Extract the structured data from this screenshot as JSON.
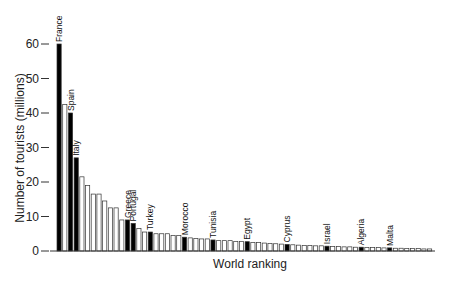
{
  "chart_data": {
    "type": "bar",
    "title": "",
    "xlabel": "World ranking",
    "ylabel": "Number of tourists (millions)",
    "ylim": [
      0,
      60
    ],
    "yticks": [
      0,
      10,
      20,
      30,
      40,
      50,
      60
    ],
    "grid": false,
    "legend": null,
    "colors": {
      "highlighted": "#000000",
      "other": "#ffffff",
      "outline": "#333333"
    },
    "bars": [
      {
        "label": "France",
        "value": 60,
        "highlight": true
      },
      {
        "label": "",
        "value": 42.5,
        "highlight": false
      },
      {
        "label": "Spain",
        "value": 40,
        "highlight": true
      },
      {
        "label": "Italy",
        "value": 27,
        "highlight": true
      },
      {
        "label": "",
        "value": 21.5,
        "highlight": false
      },
      {
        "label": "",
        "value": 19,
        "highlight": false
      },
      {
        "label": "",
        "value": 16.5,
        "highlight": false
      },
      {
        "label": "",
        "value": 16.5,
        "highlight": false
      },
      {
        "label": "",
        "value": 14.5,
        "highlight": false
      },
      {
        "label": "",
        "value": 12.5,
        "highlight": false
      },
      {
        "label": "",
        "value": 12.5,
        "highlight": false
      },
      {
        "label": "",
        "value": 9,
        "highlight": false
      },
      {
        "label": "Greece",
        "value": 9,
        "highlight": true
      },
      {
        "label": "Portugal",
        "value": 8,
        "highlight": true
      },
      {
        "label": "",
        "value": 6.5,
        "highlight": false
      },
      {
        "label": "",
        "value": 5.5,
        "highlight": false
      },
      {
        "label": "Turkey",
        "value": 5.5,
        "highlight": true
      },
      {
        "label": "",
        "value": 5,
        "highlight": false
      },
      {
        "label": "",
        "value": 5,
        "highlight": false
      },
      {
        "label": "",
        "value": 5,
        "highlight": false
      },
      {
        "label": "",
        "value": 4.5,
        "highlight": false
      },
      {
        "label": "",
        "value": 4.5,
        "highlight": false
      },
      {
        "label": "Morocco",
        "value": 4,
        "highlight": true
      },
      {
        "label": "",
        "value": 3.8,
        "highlight": false
      },
      {
        "label": "",
        "value": 3.6,
        "highlight": false
      },
      {
        "label": "",
        "value": 3.5,
        "highlight": false
      },
      {
        "label": "",
        "value": 3.5,
        "highlight": false
      },
      {
        "label": "Tunisia",
        "value": 3.2,
        "highlight": true
      },
      {
        "label": "",
        "value": 3,
        "highlight": false
      },
      {
        "label": "",
        "value": 3,
        "highlight": false
      },
      {
        "label": "",
        "value": 3,
        "highlight": false
      },
      {
        "label": "",
        "value": 2.8,
        "highlight": false
      },
      {
        "label": "",
        "value": 2.8,
        "highlight": false
      },
      {
        "label": "Egypt",
        "value": 2.7,
        "highlight": true
      },
      {
        "label": "",
        "value": 2.5,
        "highlight": false
      },
      {
        "label": "",
        "value": 2.5,
        "highlight": false
      },
      {
        "label": "",
        "value": 2.3,
        "highlight": false
      },
      {
        "label": "",
        "value": 2.2,
        "highlight": false
      },
      {
        "label": "",
        "value": 2.1,
        "highlight": false
      },
      {
        "label": "",
        "value": 2,
        "highlight": false
      },
      {
        "label": "Cyprus",
        "value": 1.9,
        "highlight": true
      },
      {
        "label": "",
        "value": 1.8,
        "highlight": false
      },
      {
        "label": "",
        "value": 1.7,
        "highlight": false
      },
      {
        "label": "",
        "value": 1.6,
        "highlight": false
      },
      {
        "label": "",
        "value": 1.6,
        "highlight": false
      },
      {
        "label": "",
        "value": 1.5,
        "highlight": false
      },
      {
        "label": "",
        "value": 1.5,
        "highlight": false
      },
      {
        "label": "Israel",
        "value": 1.4,
        "highlight": true
      },
      {
        "label": "",
        "value": 1.3,
        "highlight": false
      },
      {
        "label": "",
        "value": 1.3,
        "highlight": false
      },
      {
        "label": "",
        "value": 1.2,
        "highlight": false
      },
      {
        "label": "",
        "value": 1.2,
        "highlight": false
      },
      {
        "label": "",
        "value": 1.1,
        "highlight": false
      },
      {
        "label": "Algeria",
        "value": 1.1,
        "highlight": true
      },
      {
        "label": "",
        "value": 1,
        "highlight": false
      },
      {
        "label": "",
        "value": 1,
        "highlight": false
      },
      {
        "label": "",
        "value": 1,
        "highlight": false
      },
      {
        "label": "",
        "value": 0.9,
        "highlight": false
      },
      {
        "label": "Malta",
        "value": 0.9,
        "highlight": true
      },
      {
        "label": "",
        "value": 0.8,
        "highlight": false
      },
      {
        "label": "",
        "value": 0.8,
        "highlight": false
      },
      {
        "label": "",
        "value": 0.7,
        "highlight": false
      },
      {
        "label": "",
        "value": 0.7,
        "highlight": false
      },
      {
        "label": "",
        "value": 0.7,
        "highlight": false
      },
      {
        "label": "",
        "value": 0.6,
        "highlight": false
      },
      {
        "label": "",
        "value": 0.6,
        "highlight": false
      }
    ]
  }
}
